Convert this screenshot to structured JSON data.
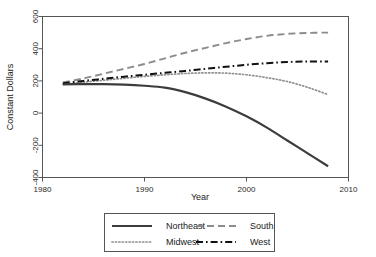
{
  "chart_data": {
    "type": "line",
    "title": "",
    "xlabel": "Year",
    "ylabel": "Constant Dollars",
    "xlim": [
      1980,
      2010
    ],
    "ylim": [
      -400,
      600
    ],
    "xticks": [
      1980,
      1990,
      2000,
      2010
    ],
    "yticks": [
      600,
      400,
      200,
      0,
      -200,
      -400
    ],
    "xtick_labels": [
      "1980",
      "1990",
      "2000",
      "2010"
    ],
    "ytick_labels": [
      "600",
      "400",
      "200",
      "0",
      "-200",
      "-400"
    ],
    "grid": false,
    "legend_position": "below-center",
    "x": [
      1982,
      1984,
      1986,
      1988,
      1990,
      1992,
      1994,
      1996,
      1998,
      2000,
      2002,
      2004,
      2006,
      2008
    ],
    "series": [
      {
        "name": "Northeast",
        "style": "solid",
        "color": "#3c3c3c",
        "width": 2.2,
        "values": [
          178,
          180,
          180,
          177,
          170,
          158,
          130,
          90,
          40,
          -20,
          -90,
          -170,
          -250,
          -330
        ]
      },
      {
        "name": "South",
        "style": "dashed",
        "color": "#8c8c8c",
        "width": 1.9,
        "values": [
          190,
          215,
          245,
          275,
          305,
          340,
          375,
          405,
          435,
          460,
          480,
          492,
          498,
          500
        ]
      },
      {
        "name": "Midwest",
        "style": "dotted",
        "color": "#909090",
        "width": 1.7,
        "values": [
          180,
          192,
          204,
          216,
          228,
          238,
          246,
          250,
          248,
          238,
          220,
          196,
          160,
          115
        ]
      },
      {
        "name": "West",
        "style": "dashdot",
        "color": "#101010",
        "width": 2.0,
        "values": [
          185,
          200,
          213,
          226,
          238,
          250,
          262,
          275,
          288,
          300,
          310,
          317,
          321,
          320
        ]
      }
    ]
  },
  "legend": {
    "entries": [
      {
        "label": "Northeast"
      },
      {
        "label": "South"
      },
      {
        "label": "Midwest"
      },
      {
        "label": "West"
      }
    ]
  },
  "axes": {
    "x_title": "Year",
    "y_title": "Constant Dollars"
  }
}
